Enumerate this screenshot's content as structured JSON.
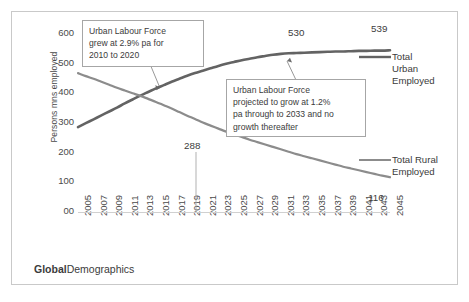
{
  "chart_data": {
    "type": "line",
    "title": "",
    "xlabel": "",
    "ylabel": "Persons mns employed",
    "ylim": [
      0,
      600
    ],
    "ytick_labels": [
      "00",
      "100",
      "200",
      "300",
      "400",
      "500",
      "600"
    ],
    "ytick_values": [
      0,
      100,
      200,
      300,
      400,
      500,
      600
    ],
    "grid": false,
    "legend_position": "right",
    "x": [
      2005,
      2006,
      2007,
      2008,
      2009,
      2010,
      2011,
      2012,
      2013,
      2014,
      2015,
      2016,
      2017,
      2018,
      2019,
      2020,
      2021,
      2022,
      2023,
      2024,
      2025,
      2026,
      2027,
      2028,
      2029,
      2030,
      2031,
      2032,
      2033,
      2034,
      2035,
      2036,
      2037,
      2038,
      2039,
      2040,
      2041,
      2042,
      2043,
      2044,
      2045
    ],
    "xtick_labels": [
      "2005",
      "2007",
      "2009",
      "2011",
      "2013",
      "2015",
      "2017",
      "2019",
      "2021",
      "2023",
      "2025",
      "2027",
      "2029",
      "2031",
      "2033",
      "2035",
      "2037",
      "2039",
      "2041",
      "2043",
      "2045"
    ],
    "series": [
      {
        "name": "Total Urban Employed",
        "color": "#636363",
        "values": [
          283,
          296,
          309,
          322,
          335,
          348,
          362,
          375,
          388,
          400,
          412,
          423,
          434,
          444,
          454,
          463,
          471,
          479,
          487,
          494,
          500,
          506,
          511,
          516,
          520,
          524,
          527,
          529,
          530,
          531,
          532,
          533,
          534,
          535,
          535,
          536,
          537,
          537,
          538,
          538,
          539
        ]
      },
      {
        "name": "Total Rural Employed",
        "color": "#8c8c8c",
        "values": [
          463,
          453,
          444,
          434,
          424,
          414,
          405,
          396,
          387,
          377,
          367,
          356,
          345,
          333,
          321,
          310,
          298,
          288,
          278,
          268,
          259,
          250,
          241,
          233,
          225,
          217,
          209,
          201,
          193,
          186,
          179,
          172,
          165,
          158,
          151,
          145,
          139,
          133,
          127,
          121,
          116
        ]
      }
    ],
    "data_labels": [
      {
        "text": "530",
        "x_year": 2031,
        "value": 530
      },
      {
        "text": "539",
        "x_year": 2044,
        "value": 539
      },
      {
        "text": "288",
        "x_year": 2020,
        "value": 288
      },
      {
        "text": "116",
        "x_year": 2045,
        "value": 116
      }
    ],
    "annotations": [
      {
        "id": "annotation-growth-historic",
        "text": "Urban Labour Force grew at 2.9% pa for 2010 to 2020",
        "lines": [
          "Urban Labour Force",
          "grew at 2.9% pa for",
          "2010 to 2020"
        ]
      },
      {
        "id": "annotation-growth-projected",
        "text": "Urban Labour Force projected to grow at 1.2% pa through to 2033 and no growth thereafter",
        "lines": [
          "Urban Labour Force",
          "projected to grow at 1.2%",
          "pa through to 2033 and no",
          "growth thereafter"
        ]
      }
    ]
  },
  "legend": {
    "urban": "Total\nUrban\nEmployed",
    "rural": "Total Rural\nEmployed"
  },
  "footer": {
    "brand_bold": "Global",
    "brand_light": "Demographics"
  }
}
